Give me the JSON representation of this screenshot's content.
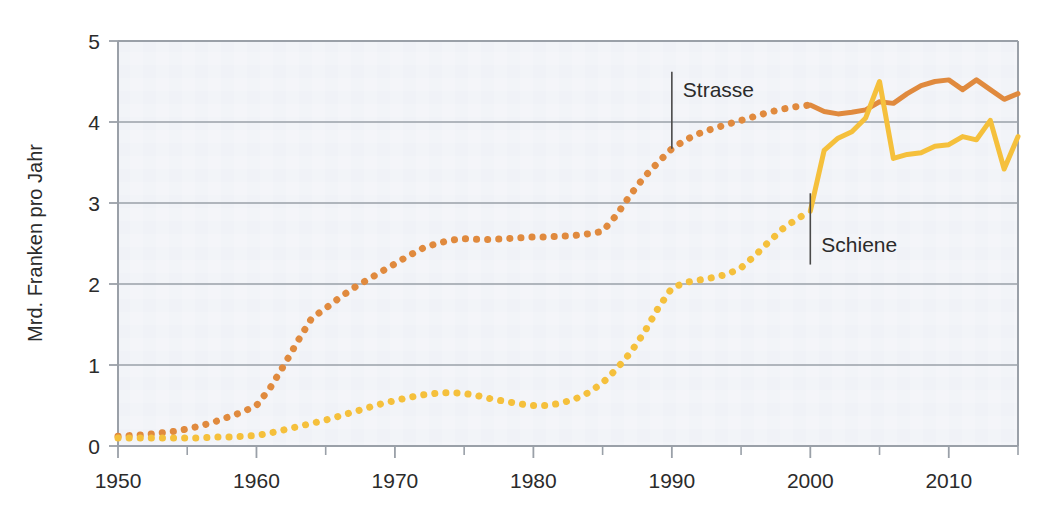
{
  "chart_data": {
    "type": "line",
    "title": "",
    "subtitle": "",
    "xlabel": "",
    "ylabel": "Mrd. Franken pro Jahr",
    "xlim": [
      1950,
      2015
    ],
    "ylim": [
      0,
      5
    ],
    "grid": "horizontal",
    "legend_position": "inline-annotations",
    "x_tick_labels": [
      "1950",
      "1960",
      "1970",
      "1980",
      "1990",
      "2000",
      "2010"
    ],
    "x_tick_values": [
      1950,
      1960,
      1970,
      1980,
      1990,
      2000,
      2010
    ],
    "x_minor_tick_values": [
      1955,
      1965,
      1975,
      1985,
      1995,
      2005,
      2015
    ],
    "y_tick_labels": [
      "0",
      "1",
      "2",
      "3",
      "4",
      "5"
    ],
    "y_tick_values": [
      0,
      1,
      2,
      3,
      4,
      5
    ],
    "annotations": [
      {
        "text": "Strasse",
        "year": 1990,
        "value": 4.4,
        "leader_from": 3.67,
        "leader_to": 4.62
      },
      {
        "text": "Schiene",
        "year": 2000,
        "value": 2.48,
        "leader_from": 2.24,
        "leader_to": 3.12
      }
    ],
    "series": [
      {
        "name": "Strasse",
        "color": "#E08A3E",
        "dotted_until": 2000,
        "x": [
          1950,
          1951,
          1952,
          1953,
          1954,
          1955,
          1956,
          1957,
          1958,
          1959,
          1960,
          1961,
          1962,
          1963,
          1964,
          1965,
          1966,
          1967,
          1968,
          1969,
          1970,
          1971,
          1972,
          1973,
          1974,
          1975,
          1976,
          1977,
          1978,
          1979,
          1980,
          1981,
          1982,
          1983,
          1984,
          1985,
          1986,
          1987,
          1988,
          1989,
          1990,
          1991,
          1992,
          1993,
          1994,
          1995,
          1996,
          1997,
          1998,
          1999,
          2000,
          2001,
          2002,
          2003,
          2004,
          2005,
          2006,
          2007,
          2008,
          2009,
          2010,
          2011,
          2012,
          2013,
          2014,
          2015
        ],
        "values": [
          0.12,
          0.13,
          0.14,
          0.16,
          0.18,
          0.21,
          0.25,
          0.3,
          0.36,
          0.42,
          0.5,
          0.72,
          1.0,
          1.3,
          1.58,
          1.7,
          1.83,
          1.95,
          2.05,
          2.15,
          2.25,
          2.35,
          2.44,
          2.5,
          2.54,
          2.56,
          2.55,
          2.55,
          2.56,
          2.57,
          2.58,
          2.58,
          2.59,
          2.6,
          2.62,
          2.65,
          2.85,
          3.1,
          3.32,
          3.5,
          3.67,
          3.78,
          3.86,
          3.92,
          3.97,
          4.02,
          4.07,
          4.12,
          4.16,
          4.19,
          4.21,
          4.13,
          4.1,
          4.12,
          4.15,
          4.25,
          4.23,
          4.35,
          4.45,
          4.5,
          4.52,
          4.4,
          4.52,
          4.4,
          4.28,
          4.35
        ]
      },
      {
        "name": "Schiene",
        "color": "#F5C03C",
        "dotted_until": 2000,
        "x": [
          1950,
          1951,
          1952,
          1953,
          1954,
          1955,
          1956,
          1957,
          1958,
          1959,
          1960,
          1961,
          1962,
          1963,
          1964,
          1965,
          1966,
          1967,
          1968,
          1969,
          1970,
          1971,
          1972,
          1973,
          1974,
          1975,
          1976,
          1977,
          1978,
          1979,
          1980,
          1981,
          1982,
          1983,
          1984,
          1985,
          1986,
          1987,
          1988,
          1989,
          1990,
          1991,
          1992,
          1993,
          1994,
          1995,
          1996,
          1997,
          1998,
          1999,
          2000,
          2001,
          2002,
          2003,
          2004,
          2005,
          2006,
          2007,
          2008,
          2009,
          2010,
          2011,
          2012,
          2013,
          2014,
          2015
        ],
        "values": [
          0.1,
          0.1,
          0.1,
          0.1,
          0.1,
          0.1,
          0.1,
          0.11,
          0.11,
          0.12,
          0.13,
          0.16,
          0.2,
          0.24,
          0.28,
          0.32,
          0.37,
          0.42,
          0.47,
          0.52,
          0.56,
          0.6,
          0.63,
          0.65,
          0.66,
          0.65,
          0.62,
          0.58,
          0.55,
          0.52,
          0.5,
          0.5,
          0.53,
          0.58,
          0.66,
          0.78,
          0.95,
          1.15,
          1.4,
          1.7,
          1.95,
          2.02,
          2.05,
          2.08,
          2.12,
          2.2,
          2.35,
          2.52,
          2.68,
          2.8,
          2.9,
          3.65,
          3.8,
          3.88,
          4.05,
          4.5,
          3.55,
          3.6,
          3.62,
          3.7,
          3.72,
          3.82,
          3.78,
          4.02,
          3.42,
          3.82
        ]
      }
    ]
  }
}
